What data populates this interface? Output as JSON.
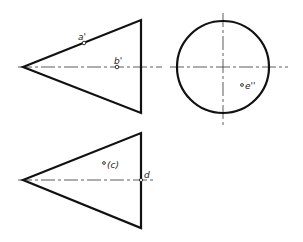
{
  "drawing": {
    "type": "orthographic projection of a cone",
    "colors": {
      "outline": "#111111",
      "centerline": "#333333",
      "background": "#ffffff"
    },
    "views": {
      "front": {
        "name": "front view (triangle)",
        "point_labels": {
          "a": "a'",
          "b": "b'"
        }
      },
      "side": {
        "name": "side view (circle)",
        "point_labels": {
          "e": "e''"
        }
      },
      "top": {
        "name": "top view (triangle)",
        "point_labels": {
          "c": "(c)",
          "d": "d"
        }
      }
    }
  }
}
